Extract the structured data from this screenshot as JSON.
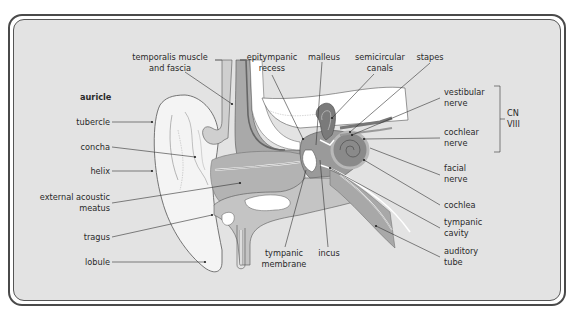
{
  "diagram": {
    "section_title": "auricle",
    "colors": {
      "background": "#e3e3e3",
      "frame": "#4a4a4a",
      "skin": "#f2f2f2",
      "tissue_mid": "#bdbdbd",
      "tissue_dark": "#8c8c8c",
      "inner_ear": "#7a7a7a",
      "bone_white": "#ffffff"
    },
    "left_labels": {
      "tubercle": "tubercle",
      "concha": "concha",
      "helix": "helix",
      "external_acoustic_meatus_1": "external acoustic",
      "external_acoustic_meatus_2": "meatus",
      "tragus": "tragus",
      "lobule": "lobule"
    },
    "top_labels": {
      "temporalis_1": "temporalis muscle",
      "temporalis_2": "and fascia",
      "epitympanic_1": "epitympanic",
      "epitympanic_2": "recess",
      "malleus": "malleus",
      "semicircular_1": "semicircular",
      "semicircular_2": "canals",
      "stapes": "stapes"
    },
    "right_labels": {
      "vestibular_1": "vestibular",
      "vestibular_2": "nerve",
      "cochlear_1": "cochlear",
      "cochlear_2": "nerve",
      "cn_1": "CN",
      "cn_2": "VIII",
      "facial_1": "facial",
      "facial_2": "nerve",
      "cochlea": "cochlea",
      "tympanic_cavity_1": "tympanic",
      "tympanic_cavity_2": "cavity",
      "auditory_tube_1": "auditory",
      "auditory_tube_2": "tube"
    },
    "bottom_labels": {
      "tympanic_membrane_1": "tympanic",
      "tympanic_membrane_2": "membrane",
      "incus": "incus"
    }
  }
}
